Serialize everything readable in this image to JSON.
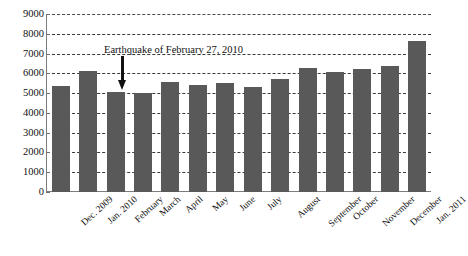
{
  "chart_data": {
    "type": "bar",
    "title": "",
    "xlabel": "",
    "ylabel": "",
    "ylim": [
      0,
      9000
    ],
    "ytick_step": 1000,
    "grid": true,
    "legend": "none",
    "bar_color": "#595959",
    "categories": [
      "Dec. 2009",
      "Jan. 2010",
      "February",
      "March",
      "April",
      "May",
      "June",
      "July",
      "August",
      "September",
      "October",
      "November",
      "December",
      "Jan. 2011"
    ],
    "values": [
      5350,
      6100,
      5050,
      5000,
      5550,
      5400,
      5500,
      5300,
      5700,
      6250,
      6050,
      6200,
      6350,
      7650
    ],
    "yticks": [
      "0",
      "1000",
      "2000",
      "3000",
      "4000",
      "5000",
      "6000",
      "7000",
      "8000",
      "9000"
    ],
    "annotations": [
      {
        "text": "Earthquake of February 27, 2010",
        "marker": "down-arrow",
        "points_to_category": "February"
      }
    ]
  }
}
